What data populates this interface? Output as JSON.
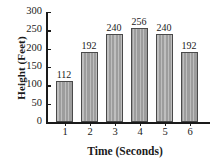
{
  "chart_data": {
    "type": "bar",
    "title": "",
    "xlabel": "Time (Seconds)",
    "ylabel": "Height (Feet)",
    "categories": [
      "1",
      "2",
      "3",
      "4",
      "5",
      "6"
    ],
    "values": [
      112,
      192,
      240,
      256,
      240,
      192
    ],
    "value_labels": [
      "112",
      "192",
      "240",
      "256",
      "240",
      "192"
    ],
    "ylim": [
      0,
      300
    ],
    "yticks": [
      0,
      50,
      100,
      150,
      200,
      250,
      300
    ],
    "ytick_labels": [
      "0",
      "50",
      "100",
      "150",
      "200",
      "250",
      "300"
    ],
    "grid": false,
    "legend": null,
    "colors": {
      "bar_fill": "#a3a3a3",
      "bar_edge": "#4a4a4a",
      "axis": "#1a1a1a",
      "background": "#ffffff",
      "text": "#1a1a1a"
    }
  }
}
